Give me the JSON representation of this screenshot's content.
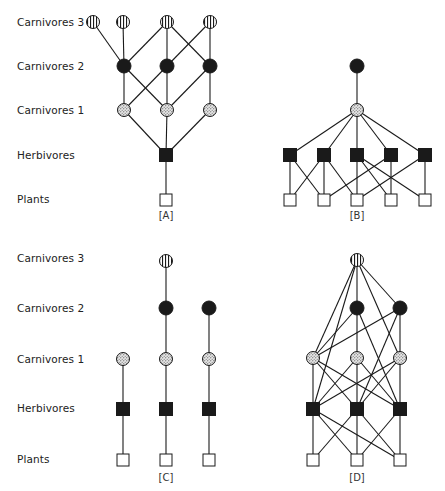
{
  "figure": {
    "levels": [
      "Carnivores 3",
      "Carnivores 2",
      "Carnivores 1",
      "Herbivores",
      "Plants"
    ],
    "legend_node_styles": {
      "Carnivores 3": "circle-vertical-stripes",
      "Carnivores 2": "circle-solid-black",
      "Carnivores 1": "circle-stippled",
      "Herbivores": "square-solid-black",
      "Plants": "square-white"
    },
    "colors": {
      "ink": "#1a1a1a",
      "background": "#ffffff",
      "stipple": "#d9d9d9"
    }
  },
  "label_rows": [
    {
      "label_ys": [
        22,
        66,
        110,
        155,
        199
      ]
    },
    {
      "label_ys": [
        258,
        308,
        359,
        408,
        459
      ]
    }
  ],
  "panels": [
    {
      "id": "A",
      "label": "[A]",
      "label_pos": [
        166,
        215
      ],
      "nodes": {
        "C3_1": {
          "type": "c3",
          "x": 93,
          "y": 22
        },
        "C3_2": {
          "type": "c3",
          "x": 123,
          "y": 22
        },
        "C3_3": {
          "type": "c3",
          "x": 167,
          "y": 22
        },
        "C3_4": {
          "type": "c3",
          "x": 210,
          "y": 22
        },
        "C2_1": {
          "type": "c2",
          "x": 124,
          "y": 66
        },
        "C2_2": {
          "type": "c2",
          "x": 167,
          "y": 66
        },
        "C2_3": {
          "type": "c2",
          "x": 210,
          "y": 66
        },
        "C1_1": {
          "type": "c1",
          "x": 124,
          "y": 110
        },
        "C1_2": {
          "type": "c1",
          "x": 167,
          "y": 110
        },
        "C1_3": {
          "type": "c1",
          "x": 210,
          "y": 110
        },
        "H1": {
          "type": "h",
          "x": 166,
          "y": 155
        },
        "P1": {
          "type": "p",
          "x": 166,
          "y": 200
        }
      },
      "edges": [
        [
          "C3_1",
          "C2_1"
        ],
        [
          "C3_2",
          "C2_1"
        ],
        [
          "C3_3",
          "C2_1"
        ],
        [
          "C3_3",
          "C2_2"
        ],
        [
          "C3_3",
          "C2_3"
        ],
        [
          "C3_4",
          "C2_2"
        ],
        [
          "C3_4",
          "C2_3"
        ],
        [
          "C2_1",
          "C1_1"
        ],
        [
          "C2_1",
          "C1_2"
        ],
        [
          "C2_2",
          "C1_1"
        ],
        [
          "C2_2",
          "C1_2"
        ],
        [
          "C2_3",
          "C1_2"
        ],
        [
          "C2_3",
          "C1_3"
        ],
        [
          "C1_1",
          "H1"
        ],
        [
          "C1_2",
          "H1"
        ],
        [
          "C1_3",
          "H1"
        ],
        [
          "H1",
          "P1"
        ]
      ]
    },
    {
      "id": "B",
      "label": "[B]",
      "label_pos": [
        357,
        215
      ],
      "nodes": {
        "C2_1": {
          "type": "c2",
          "x": 357,
          "y": 66
        },
        "C1_1": {
          "type": "c1",
          "x": 357,
          "y": 110
        },
        "H1": {
          "type": "h",
          "x": 290,
          "y": 155
        },
        "H2": {
          "type": "h",
          "x": 324,
          "y": 155
        },
        "H3": {
          "type": "h",
          "x": 357,
          "y": 155
        },
        "H4": {
          "type": "h",
          "x": 391,
          "y": 155
        },
        "H5": {
          "type": "h",
          "x": 425,
          "y": 155
        },
        "P1": {
          "type": "p",
          "x": 290,
          "y": 200
        },
        "P2": {
          "type": "p",
          "x": 324,
          "y": 200
        },
        "P3": {
          "type": "p",
          "x": 357,
          "y": 200
        },
        "P4": {
          "type": "p",
          "x": 391,
          "y": 200
        },
        "P5": {
          "type": "p",
          "x": 425,
          "y": 200
        }
      },
      "edges": [
        [
          "C2_1",
          "C1_1"
        ],
        [
          "C1_1",
          "H1"
        ],
        [
          "C1_1",
          "H2"
        ],
        [
          "C1_1",
          "H3"
        ],
        [
          "C1_1",
          "H4"
        ],
        [
          "C1_1",
          "H5"
        ],
        [
          "H1",
          "P1"
        ],
        [
          "H1",
          "P2"
        ],
        [
          "H2",
          "P1"
        ],
        [
          "H2",
          "P2"
        ],
        [
          "H2",
          "P3"
        ],
        [
          "H3",
          "P3"
        ],
        [
          "H3",
          "P4"
        ],
        [
          "H3",
          "P5"
        ],
        [
          "H4",
          "P2"
        ],
        [
          "H4",
          "P4"
        ],
        [
          "H5",
          "P3"
        ],
        [
          "H5",
          "P5"
        ]
      ]
    },
    {
      "id": "C",
      "label": "[C]",
      "label_pos": [
        166,
        477
      ],
      "nodes": {
        "C3_1": {
          "type": "c3",
          "x": 166,
          "y": 261
        },
        "C2_1": {
          "type": "c2",
          "x": 166,
          "y": 308
        },
        "C2_2": {
          "type": "c2",
          "x": 209,
          "y": 308
        },
        "C1_0": {
          "type": "c1",
          "x": 123,
          "y": 359
        },
        "C1_1": {
          "type": "c1",
          "x": 166,
          "y": 359
        },
        "C1_2": {
          "type": "c1",
          "x": 209,
          "y": 359
        },
        "H0": {
          "type": "h",
          "x": 123,
          "y": 409
        },
        "H1": {
          "type": "h",
          "x": 166,
          "y": 409
        },
        "H2": {
          "type": "h",
          "x": 209,
          "y": 409
        },
        "P0": {
          "type": "p",
          "x": 123,
          "y": 460
        },
        "P1": {
          "type": "p",
          "x": 166,
          "y": 460
        },
        "P2": {
          "type": "p",
          "x": 209,
          "y": 460
        }
      },
      "edges": [
        [
          "C3_1",
          "C2_1"
        ],
        [
          "C2_1",
          "C1_1"
        ],
        [
          "C1_1",
          "H1"
        ],
        [
          "H1",
          "P1"
        ],
        [
          "C2_2",
          "C1_2"
        ],
        [
          "C1_2",
          "H2"
        ],
        [
          "H2",
          "P2"
        ],
        [
          "C1_0",
          "H0"
        ],
        [
          "H0",
          "P0"
        ]
      ]
    },
    {
      "id": "D",
      "label": "[D]",
      "label_pos": [
        357,
        477
      ],
      "nodes": {
        "C3_1": {
          "type": "c3",
          "x": 357,
          "y": 260
        },
        "C2_1": {
          "type": "c2",
          "x": 357,
          "y": 308
        },
        "C2_2": {
          "type": "c2",
          "x": 400,
          "y": 308
        },
        "C1_1": {
          "type": "c1",
          "x": 313,
          "y": 358
        },
        "C1_2": {
          "type": "c1",
          "x": 357,
          "y": 358
        },
        "C1_3": {
          "type": "c1",
          "x": 400,
          "y": 358
        },
        "H1": {
          "type": "h",
          "x": 313,
          "y": 409
        },
        "H2": {
          "type": "h",
          "x": 357,
          "y": 409
        },
        "H3": {
          "type": "h",
          "x": 400,
          "y": 409
        },
        "P1": {
          "type": "p",
          "x": 313,
          "y": 460
        },
        "P2": {
          "type": "p",
          "x": 357,
          "y": 460
        },
        "P3": {
          "type": "p",
          "x": 400,
          "y": 460
        }
      },
      "edges": [
        [
          "C3_1",
          "C2_1"
        ],
        [
          "C3_1",
          "C2_2"
        ],
        [
          "C3_1",
          "C1_1"
        ],
        [
          "C3_1",
          "H1"
        ],
        [
          "C3_1",
          "C1_3"
        ],
        [
          "C2_1",
          "C1_1"
        ],
        [
          "C2_1",
          "C1_2"
        ],
        [
          "C2_1",
          "H3"
        ],
        [
          "C2_2",
          "C1_1"
        ],
        [
          "C2_2",
          "C1_3"
        ],
        [
          "C2_2",
          "H2"
        ],
        [
          "C1_1",
          "H1"
        ],
        [
          "C1_1",
          "H2"
        ],
        [
          "C1_1",
          "H3"
        ],
        [
          "C1_2",
          "H1"
        ],
        [
          "C1_2",
          "H2"
        ],
        [
          "C1_2",
          "H3"
        ],
        [
          "C1_3",
          "H1"
        ],
        [
          "C1_3",
          "H2"
        ],
        [
          "C1_3",
          "H3"
        ],
        [
          "H1",
          "P1"
        ],
        [
          "H1",
          "P2"
        ],
        [
          "H1",
          "P3"
        ],
        [
          "H2",
          "P1"
        ],
        [
          "H2",
          "P2"
        ],
        [
          "H2",
          "P3"
        ],
        [
          "H3",
          "P2"
        ],
        [
          "H3",
          "P3"
        ]
      ]
    }
  ]
}
